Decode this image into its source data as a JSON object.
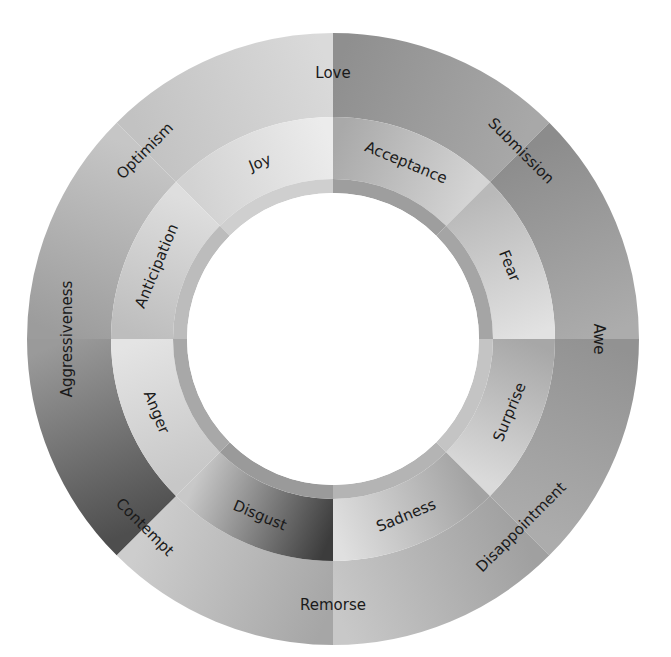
{
  "diagram": {
    "type": "emotion-wheel",
    "center": [
      333,
      339
    ],
    "radii": {
      "inner_white": 146,
      "band_inner": 146,
      "band_outer": 160,
      "primary_inner": 160,
      "primary_outer": 222,
      "outer_inner": 222,
      "outer_outer": 306
    },
    "primary_emotions": [
      {
        "label": "Joy",
        "start": -45,
        "end": 0,
        "fill_dark": "#d2d2d2",
        "fill_light": "#ececec",
        "band": "#cfcfcf"
      },
      {
        "label": "Acceptance",
        "start": 0,
        "end": 45,
        "fill_dark": "#a9a9a9",
        "fill_light": "#d4d4d4",
        "band": "#9e9e9e"
      },
      {
        "label": "Fear",
        "start": 45,
        "end": 90,
        "fill_dark": "#b9b9b9",
        "fill_light": "#e2e2e2",
        "band": "#a5a5a5"
      },
      {
        "label": "Surprise",
        "start": 90,
        "end": 135,
        "fill_dark": "#a7a7a7",
        "fill_light": "#dadada",
        "band": "#c4c4c4"
      },
      {
        "label": "Sadness",
        "start": 135,
        "end": 180,
        "fill_dark": "#a3a3a3",
        "fill_light": "#e0e0e0",
        "band": "#b4b4b4"
      },
      {
        "label": "Disgust",
        "start": 180,
        "end": 225,
        "fill_dark": "#3c3c3c",
        "fill_light": "#c8c8c8",
        "band": "#9a9a9a"
      },
      {
        "label": "Anger",
        "start": 225,
        "end": 270,
        "fill_dark": "#c7c7c7",
        "fill_light": "#e4e4e4",
        "band": "#a8a8a8"
      },
      {
        "label": "Anticipation",
        "start": 270,
        "end": 315,
        "fill_dark": "#bdbdbd",
        "fill_light": "#dedede",
        "band": "#bcbcbc"
      }
    ],
    "outer_segments": [
      {
        "start": -45,
        "end": 0,
        "fill_dark": "#c2c2c2",
        "fill_light": "#dadada"
      },
      {
        "start": 0,
        "end": 45,
        "fill_dark": "#8f8f8f",
        "fill_light": "#a8a8a8"
      },
      {
        "start": 45,
        "end": 90,
        "fill_dark": "#8c8c8c",
        "fill_light": "#acacac"
      },
      {
        "start": 90,
        "end": 135,
        "fill_dark": "#929292",
        "fill_light": "#acacac"
      },
      {
        "start": 135,
        "end": 180,
        "fill_dark": "#a0a0a0",
        "fill_light": "#c8c8c8"
      },
      {
        "start": 180,
        "end": 225,
        "fill_dark": "#a6a6a6",
        "fill_light": "#cdcdcd"
      },
      {
        "start": 225,
        "end": 270,
        "fill_dark": "#4e4e4e",
        "fill_light": "#9a9a9a"
      },
      {
        "start": 270,
        "end": 315,
        "fill_dark": "#9c9c9c",
        "fill_light": "#c6c6c6"
      }
    ],
    "dyads": [
      {
        "label": "Love",
        "angle": 0
      },
      {
        "label": "Submission",
        "angle": 45
      },
      {
        "label": "Awe",
        "angle": 90
      },
      {
        "label": "Disappointment",
        "angle": 135
      },
      {
        "label": "Remorse",
        "angle": 180
      },
      {
        "label": "Contempt",
        "angle": 225
      },
      {
        "label": "Aggressiveness",
        "angle": 270
      },
      {
        "label": "Optimism",
        "angle": 315
      }
    ],
    "colors": {
      "background": "#ffffff",
      "center": "#ffffff",
      "text": "#1a1a1a"
    }
  }
}
